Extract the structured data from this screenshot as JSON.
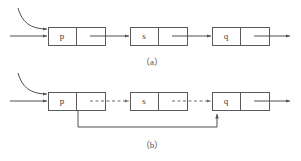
{
  "figure": {
    "background_color": "#ffffff",
    "line_color": "#4f4f4f",
    "box_stroke_color": "#5a5a5a",
    "text_color": "#3a3a3a"
  },
  "panels": [
    {
      "id": "panel-a",
      "caption": "（a）",
      "nodes": [
        {
          "id": "node-a-p",
          "label": "p"
        },
        {
          "id": "node-a-s",
          "label": "s"
        },
        {
          "id": "node-a-q",
          "label": "q"
        }
      ],
      "links": [
        {
          "id": "link-a-in",
          "style": "solid",
          "from": "entry",
          "to": "node-a-p"
        },
        {
          "id": "link-a-curve",
          "style": "solid-curved",
          "from": "external-pointer",
          "to": "node-a-p"
        },
        {
          "id": "link-a-p-s",
          "style": "solid",
          "from": "node-a-p",
          "to": "node-a-s"
        },
        {
          "id": "link-a-s-q",
          "style": "solid",
          "from": "node-a-s",
          "to": "node-a-q"
        },
        {
          "id": "link-a-out",
          "style": "solid",
          "from": "node-a-q",
          "to": "exit"
        }
      ]
    },
    {
      "id": "panel-b",
      "caption": "（b）",
      "nodes": [
        {
          "id": "node-b-p",
          "label": "p"
        },
        {
          "id": "node-b-s",
          "label": "s"
        },
        {
          "id": "node-b-q",
          "label": "q"
        }
      ],
      "links": [
        {
          "id": "link-b-in",
          "style": "solid",
          "from": "entry",
          "to": "node-b-p"
        },
        {
          "id": "link-b-curve",
          "style": "solid-curved",
          "from": "external-pointer",
          "to": "node-b-p"
        },
        {
          "id": "link-b-p-s",
          "style": "dashed",
          "from": "node-b-p",
          "to": "node-b-s"
        },
        {
          "id": "link-b-s-q",
          "style": "dashed",
          "from": "node-b-s",
          "to": "node-b-q"
        },
        {
          "id": "link-b-out",
          "style": "solid",
          "from": "node-b-q",
          "to": "exit"
        },
        {
          "id": "link-b-feedback",
          "style": "solid-routed",
          "from": "node-b-p",
          "to": "node-b-q"
        }
      ]
    }
  ]
}
